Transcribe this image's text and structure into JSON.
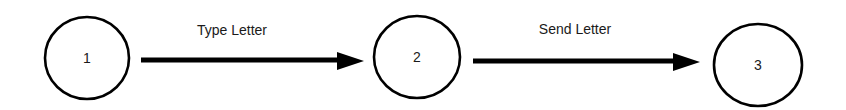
{
  "diagram": {
    "type": "state-transition",
    "nodes": [
      {
        "id": "1",
        "label": "1"
      },
      {
        "id": "2",
        "label": "2"
      },
      {
        "id": "3",
        "label": "3"
      }
    ],
    "edges": [
      {
        "from": "1",
        "to": "2",
        "label": "Type Letter"
      },
      {
        "from": "2",
        "to": "3",
        "label": "Send Letter"
      }
    ],
    "colors": {
      "stroke": "#000000",
      "background": "#ffffff",
      "text": "#1a1a1a"
    }
  }
}
